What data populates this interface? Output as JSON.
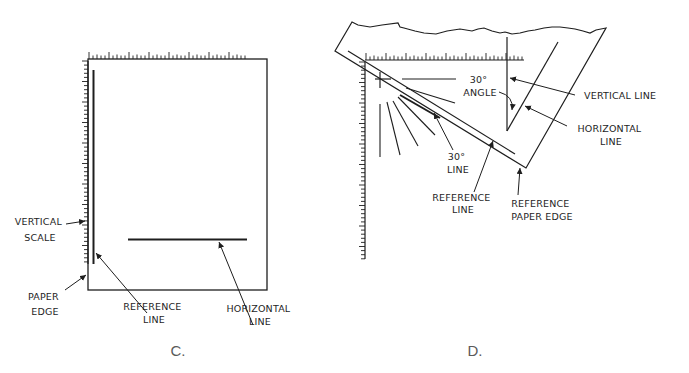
{
  "panels": [
    {
      "id": "C",
      "caption": "C.",
      "labels": {
        "vertical_scale": [
          "VERTICAL",
          "SCALE"
        ],
        "paper_edge": [
          "PAPER",
          "EDGE"
        ],
        "reference_line": [
          "REFERENCE",
          "LINE"
        ],
        "horizontal_line": [
          "HORIZONTAL",
          "LINE"
        ]
      }
    },
    {
      "id": "D",
      "caption": "D.",
      "labels": {
        "angle": [
          "30°",
          "ANGLE"
        ],
        "vertical_line": [
          "VERTICAL LINE"
        ],
        "horizontal_line": [
          "HORIZONTAL",
          "LINE"
        ],
        "thirty_line": [
          "30°",
          "LINE"
        ],
        "reference_line": [
          "REFERENCE",
          "LINE"
        ],
        "reference_paper_edge": [
          "REFERENCE",
          "PAPER EDGE"
        ]
      }
    }
  ]
}
